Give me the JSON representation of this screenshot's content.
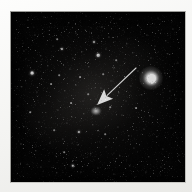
{
  "figure": {
    "domain": "astronomical-image",
    "caption": "",
    "plate": {
      "background_color": "#040404",
      "border_color": "#f3f3f1",
      "left": 10,
      "top": 11,
      "width": 176,
      "height": 172
    },
    "annotation": {
      "arrow_label": "",
      "arrow_color": "#ffffff",
      "tail_x": 126,
      "tail_y": 57,
      "tip_x": 87,
      "tip_y": 94,
      "points_to": "target-object"
    },
    "target": {
      "label": "",
      "x": 86,
      "y": 100,
      "width": 11,
      "height": 9,
      "appearance": "faint diffuse blob"
    },
    "bright_star": {
      "label": "",
      "x": 141,
      "y": 67,
      "halo_size": 24,
      "color": "#ffffff"
    },
    "stars": [
      {
        "x": 18,
        "y": 9,
        "r": 0.6,
        "o": 0.45
      },
      {
        "x": 34,
        "y": 6,
        "r": 0.5,
        "o": 0.35
      },
      {
        "x": 59,
        "y": 12,
        "r": 0.7,
        "o": 0.5
      },
      {
        "x": 76,
        "y": 5,
        "r": 0.5,
        "o": 0.4
      },
      {
        "x": 92,
        "y": 16,
        "r": 0.6,
        "o": 0.45
      },
      {
        "x": 110,
        "y": 8,
        "r": 0.5,
        "o": 0.35
      },
      {
        "x": 128,
        "y": 14,
        "r": 0.6,
        "o": 0.4
      },
      {
        "x": 148,
        "y": 7,
        "r": 0.5,
        "o": 0.35
      },
      {
        "x": 163,
        "y": 18,
        "r": 0.6,
        "o": 0.4
      },
      {
        "x": 25,
        "y": 24,
        "r": 0.6,
        "o": 0.4
      },
      {
        "x": 47,
        "y": 28,
        "r": 0.8,
        "o": 0.55
      },
      {
        "x": 66,
        "y": 22,
        "r": 0.6,
        "o": 0.4
      },
      {
        "x": 84,
        "y": 31,
        "r": 1.0,
        "o": 0.7
      },
      {
        "x": 99,
        "y": 26,
        "r": 0.6,
        "o": 0.45
      },
      {
        "x": 117,
        "y": 33,
        "r": 0.7,
        "o": 0.5
      },
      {
        "x": 137,
        "y": 24,
        "r": 0.6,
        "o": 0.4
      },
      {
        "x": 156,
        "y": 30,
        "r": 0.7,
        "o": 0.45
      },
      {
        "x": 14,
        "y": 40,
        "r": 0.6,
        "o": 0.4
      },
      {
        "x": 31,
        "y": 45,
        "r": 0.7,
        "o": 0.5
      },
      {
        "x": 52,
        "y": 38,
        "r": 1.1,
        "o": 0.8
      },
      {
        "x": 63,
        "y": 47,
        "r": 0.6,
        "o": 0.4
      },
      {
        "x": 72,
        "y": 41,
        "r": 0.7,
        "o": 0.5
      },
      {
        "x": 88,
        "y": 44,
        "r": 1.3,
        "o": 0.9
      },
      {
        "x": 96,
        "y": 38,
        "r": 0.6,
        "o": 0.4
      },
      {
        "x": 106,
        "y": 49,
        "r": 0.8,
        "o": 0.55
      },
      {
        "x": 123,
        "y": 42,
        "r": 0.7,
        "o": 0.5
      },
      {
        "x": 141,
        "y": 47,
        "r": 0.6,
        "o": 0.4
      },
      {
        "x": 158,
        "y": 43,
        "r": 0.7,
        "o": 0.45
      },
      {
        "x": 168,
        "y": 52,
        "r": 0.6,
        "o": 0.4
      },
      {
        "x": 9,
        "y": 58,
        "r": 0.6,
        "o": 0.4
      },
      {
        "x": 22,
        "y": 62,
        "r": 1.4,
        "o": 0.95
      },
      {
        "x": 38,
        "y": 55,
        "r": 0.7,
        "o": 0.5
      },
      {
        "x": 49,
        "y": 64,
        "r": 0.8,
        "o": 0.55
      },
      {
        "x": 60,
        "y": 58,
        "r": 0.6,
        "o": 0.45
      },
      {
        "x": 70,
        "y": 66,
        "r": 0.9,
        "o": 0.6
      },
      {
        "x": 79,
        "y": 56,
        "r": 0.7,
        "o": 0.5
      },
      {
        "x": 93,
        "y": 63,
        "r": 0.8,
        "o": 0.55
      },
      {
        "x": 104,
        "y": 57,
        "r": 0.6,
        "o": 0.4
      },
      {
        "x": 115,
        "y": 66,
        "r": 0.7,
        "o": 0.5
      },
      {
        "x": 128,
        "y": 60,
        "r": 0.6,
        "o": 0.4
      },
      {
        "x": 155,
        "y": 62,
        "r": 0.6,
        "o": 0.4
      },
      {
        "x": 167,
        "y": 70,
        "r": 0.7,
        "o": 0.45
      },
      {
        "x": 12,
        "y": 76,
        "r": 0.7,
        "o": 0.5
      },
      {
        "x": 27,
        "y": 81,
        "r": 0.6,
        "o": 0.4
      },
      {
        "x": 41,
        "y": 73,
        "r": 0.9,
        "o": 0.6
      },
      {
        "x": 55,
        "y": 80,
        "r": 0.7,
        "o": 0.5
      },
      {
        "x": 66,
        "y": 74,
        "r": 0.6,
        "o": 0.45
      },
      {
        "x": 78,
        "y": 83,
        "r": 0.8,
        "o": 0.55
      },
      {
        "x": 91,
        "y": 77,
        "r": 0.6,
        "o": 0.4
      },
      {
        "x": 109,
        "y": 82,
        "r": 0.7,
        "o": 0.5
      },
      {
        "x": 121,
        "y": 75,
        "r": 0.6,
        "o": 0.4
      },
      {
        "x": 132,
        "y": 84,
        "r": 0.7,
        "o": 0.5
      },
      {
        "x": 160,
        "y": 80,
        "r": 0.6,
        "o": 0.4
      },
      {
        "x": 171,
        "y": 88,
        "r": 0.6,
        "o": 0.4
      },
      {
        "x": 8,
        "y": 95,
        "r": 0.6,
        "o": 0.4
      },
      {
        "x": 20,
        "y": 101,
        "r": 0.8,
        "o": 0.6
      },
      {
        "x": 35,
        "y": 93,
        "r": 0.7,
        "o": 0.5
      },
      {
        "x": 48,
        "y": 99,
        "r": 0.6,
        "o": 0.45
      },
      {
        "x": 61,
        "y": 92,
        "r": 0.9,
        "o": 0.6
      },
      {
        "x": 74,
        "y": 103,
        "r": 0.7,
        "o": 0.5
      },
      {
        "x": 100,
        "y": 96,
        "r": 0.8,
        "o": 0.55
      },
      {
        "x": 112,
        "y": 104,
        "r": 0.6,
        "o": 0.4
      },
      {
        "x": 126,
        "y": 97,
        "r": 0.9,
        "o": 0.6
      },
      {
        "x": 140,
        "y": 105,
        "r": 0.7,
        "o": 0.5
      },
      {
        "x": 152,
        "y": 95,
        "r": 0.6,
        "o": 0.4
      },
      {
        "x": 166,
        "y": 103,
        "r": 0.7,
        "o": 0.45
      },
      {
        "x": 14,
        "y": 116,
        "r": 0.7,
        "o": 0.5
      },
      {
        "x": 29,
        "y": 111,
        "r": 0.6,
        "o": 0.4
      },
      {
        "x": 44,
        "y": 119,
        "r": 0.8,
        "o": 0.55
      },
      {
        "x": 57,
        "y": 112,
        "r": 0.6,
        "o": 0.45
      },
      {
        "x": 69,
        "y": 121,
        "r": 1.1,
        "o": 0.8
      },
      {
        "x": 83,
        "y": 114,
        "r": 0.7,
        "o": 0.5
      },
      {
        "x": 95,
        "y": 123,
        "r": 0.8,
        "o": 0.55
      },
      {
        "x": 108,
        "y": 116,
        "r": 0.6,
        "o": 0.4
      },
      {
        "x": 119,
        "y": 125,
        "r": 0.7,
        "o": 0.5
      },
      {
        "x": 134,
        "y": 118,
        "r": 0.6,
        "o": 0.4
      },
      {
        "x": 147,
        "y": 126,
        "r": 0.7,
        "o": 0.45
      },
      {
        "x": 161,
        "y": 117,
        "r": 0.6,
        "o": 0.4
      },
      {
        "x": 11,
        "y": 133,
        "r": 0.6,
        "o": 0.4
      },
      {
        "x": 26,
        "y": 140,
        "r": 0.7,
        "o": 0.5
      },
      {
        "x": 40,
        "y": 132,
        "r": 0.6,
        "o": 0.4
      },
      {
        "x": 54,
        "y": 141,
        "r": 0.8,
        "o": 0.55
      },
      {
        "x": 68,
        "y": 134,
        "r": 0.6,
        "o": 0.4
      },
      {
        "x": 81,
        "y": 143,
        "r": 0.7,
        "o": 0.5
      },
      {
        "x": 96,
        "y": 136,
        "r": 0.6,
        "o": 0.4
      },
      {
        "x": 110,
        "y": 145,
        "r": 0.7,
        "o": 0.5
      },
      {
        "x": 124,
        "y": 137,
        "r": 0.6,
        "o": 0.4
      },
      {
        "x": 139,
        "y": 146,
        "r": 0.7,
        "o": 0.45
      },
      {
        "x": 153,
        "y": 138,
        "r": 0.6,
        "o": 0.4
      },
      {
        "x": 169,
        "y": 144,
        "r": 0.6,
        "o": 0.35
      },
      {
        "x": 31,
        "y": 156,
        "r": 0.6,
        "o": 0.4
      },
      {
        "x": 47,
        "y": 162,
        "r": 0.7,
        "o": 0.45
      },
      {
        "x": 63,
        "y": 155,
        "r": 1.2,
        "o": 0.8
      },
      {
        "x": 71,
        "y": 161,
        "r": 0.6,
        "o": 0.4
      },
      {
        "x": 88,
        "y": 157,
        "r": 0.6,
        "o": 0.4
      },
      {
        "x": 104,
        "y": 163,
        "r": 0.6,
        "o": 0.4
      },
      {
        "x": 120,
        "y": 155,
        "r": 0.7,
        "o": 0.45
      },
      {
        "x": 136,
        "y": 161,
        "r": 0.6,
        "o": 0.4
      },
      {
        "x": 151,
        "y": 156,
        "r": 0.6,
        "o": 0.35
      },
      {
        "x": 43,
        "y": 35,
        "r": 0.5,
        "o": 0.3
      },
      {
        "x": 101,
        "y": 70,
        "r": 0.5,
        "o": 0.3
      },
      {
        "x": 86,
        "y": 88,
        "r": 0.5,
        "o": 0.3
      },
      {
        "x": 73,
        "y": 90,
        "r": 0.5,
        "o": 0.3
      },
      {
        "x": 116,
        "y": 90,
        "r": 0.5,
        "o": 0.3
      },
      {
        "x": 62,
        "y": 106,
        "r": 0.5,
        "o": 0.3
      },
      {
        "x": 145,
        "y": 35,
        "r": 0.5,
        "o": 0.3
      },
      {
        "x": 53,
        "y": 128,
        "r": 0.5,
        "o": 0.3
      }
    ]
  }
}
